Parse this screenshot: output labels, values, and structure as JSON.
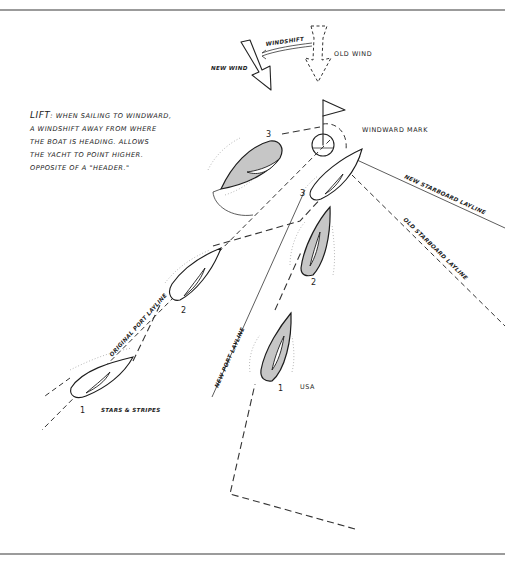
{
  "figure": {
    "definition": {
      "term": "LIFT",
      "lines": [
        "WHEN SAILING TO WINDWARD,",
        "A WINDSHIFT  AWAY FROM WHERE",
        "THE BOAT IS HEADING. ALLOWS",
        "THE YACHT  TO POINT HIGHER.",
        "OPPOSITE OF A \"HEADER.\""
      ]
    },
    "wind": {
      "new_wind_label": "NEW WIND",
      "old_wind_label": "OLD WIND",
      "windshift_label": "WINDSHIFT"
    },
    "mark": {
      "label": "WINDWARD MARK"
    },
    "laylines": {
      "new_starboard": "NEW STARBOARD LAYLINE",
      "old_starboard": "OLD STARBOARD LAYLINE",
      "original_port": "ORIGINAL PORT LAYLINE",
      "new_port": "NEW PORT LAYLINE"
    },
    "boats": {
      "usa": {
        "name": "USA",
        "color": "#c6c6c6",
        "positions": [
          "1",
          "2",
          "3"
        ]
      },
      "stars_and_stripes": {
        "name": "STARS & STRIPES",
        "color": "#ffffff",
        "positions": [
          "1",
          "2",
          "3"
        ]
      }
    }
  }
}
